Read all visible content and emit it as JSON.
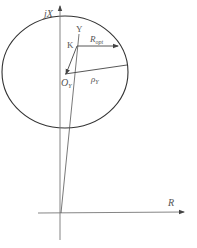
{
  "diagram": {
    "type": "impedance-plane-geometry",
    "axes": {
      "vertical_label": "jX",
      "horizontal_label": "R"
    },
    "points": {
      "Y": "Y",
      "K": "K",
      "O": {
        "base": "O",
        "sub": "Y"
      }
    },
    "segments": {
      "R_opt": {
        "base": "R",
        "sub": "opt"
      },
      "rho": {
        "base": "ρ",
        "sub": "Y"
      }
    },
    "colors": {
      "line": "#444444",
      "axis": "#777777",
      "circle": "#333333",
      "background": "#ffffff"
    }
  }
}
